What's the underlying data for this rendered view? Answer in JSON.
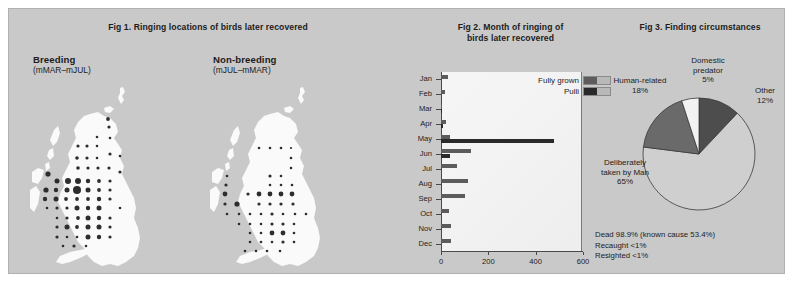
{
  "colors": {
    "panel_bg": "#c9c9c9",
    "land": "#fafafa",
    "dot": "#2d2d2d",
    "bar_fully_grown": "#5c5c5c",
    "bar_pulli": "#2a2a2a",
    "pie_deliberately": "#cfcfcf",
    "pie_human": "#6a6a6a",
    "pie_domestic": "#f2f2f2",
    "pie_other": "#4d4d4d",
    "plot_bg": "#f2f2f2",
    "axis": "#4a4a4a",
    "text": "#1c1c1c"
  },
  "fig1": {
    "title": "Fig 1. Ringing locations of birds later recovered",
    "maps": [
      {
        "heading": "Breeding",
        "subheading": "(mMAR–mJUL)"
      },
      {
        "heading": "Non-breeding",
        "subheading": "(mJUL–mMAR)"
      }
    ]
  },
  "fig2": {
    "title_line1": "Fig 2. Month of ringing of",
    "title_line2": "birds later recovered",
    "legend": [
      {
        "label": "Fully grown",
        "color": "#5c5c5c"
      },
      {
        "label": "Pulli",
        "color": "#2a2a2a"
      }
    ],
    "chart_data": {
      "type": "bar",
      "orientation": "horizontal",
      "title": "Fig 2. Month of ringing of birds later recovered",
      "xlabel": "",
      "ylabel": "",
      "xlim": [
        0,
        600
      ],
      "xticks": [
        0,
        200,
        400,
        600
      ],
      "xtick_labels": [
        "0",
        "200",
        "400",
        "600"
      ],
      "grid": false,
      "legend_position": "top-right",
      "categories": [
        "Jan",
        "Feb",
        "Mar",
        "Apr",
        "May",
        "Jun",
        "Jul",
        "Aug",
        "Sep",
        "Oct",
        "Nov",
        "Dec"
      ],
      "series": [
        {
          "name": "Fully grown",
          "color": "#5c5c5c",
          "values": [
            30,
            18,
            6,
            22,
            38,
            128,
            68,
            112,
            100,
            34,
            42,
            44,
            26
          ]
        },
        {
          "name": "Pulli",
          "color": "#2a2a2a",
          "values": [
            0,
            0,
            2,
            10,
            478,
            36,
            0,
            0,
            0,
            0,
            0,
            0
          ]
        }
      ]
    }
  },
  "fig3": {
    "title": "Fig 3. Finding circumstances",
    "chart_data": {
      "type": "pie",
      "title": "Fig 3. Finding circumstances",
      "labels": [
        "Deliberately taken by Man",
        "Human-related",
        "Domestic predator",
        "Other"
      ],
      "values": [
        65,
        18,
        5,
        12
      ],
      "value_labels": [
        "65%",
        "18%",
        "5%",
        "12%"
      ],
      "colors": [
        "#cfcfcf",
        "#6a6a6a",
        "#f2f2f2",
        "#4d4d4d"
      ]
    },
    "labels": [
      {
        "name": "domestic-predator",
        "line1": "Domestic",
        "line2": "predator",
        "pct": "5%"
      },
      {
        "name": "human-related",
        "line1": "Human-related",
        "line2": "",
        "pct": "18%"
      },
      {
        "name": "other",
        "line1": "Other",
        "line2": "",
        "pct": "12%"
      },
      {
        "name": "deliberately-taken",
        "line1": "Deliberately",
        "line2": "taken by Man",
        "pct": "65%"
      }
    ],
    "footnote": [
      "Dead 98.9% (known cause 53.4%)",
      "Recaught <1%",
      "Resighted <1%"
    ]
  }
}
